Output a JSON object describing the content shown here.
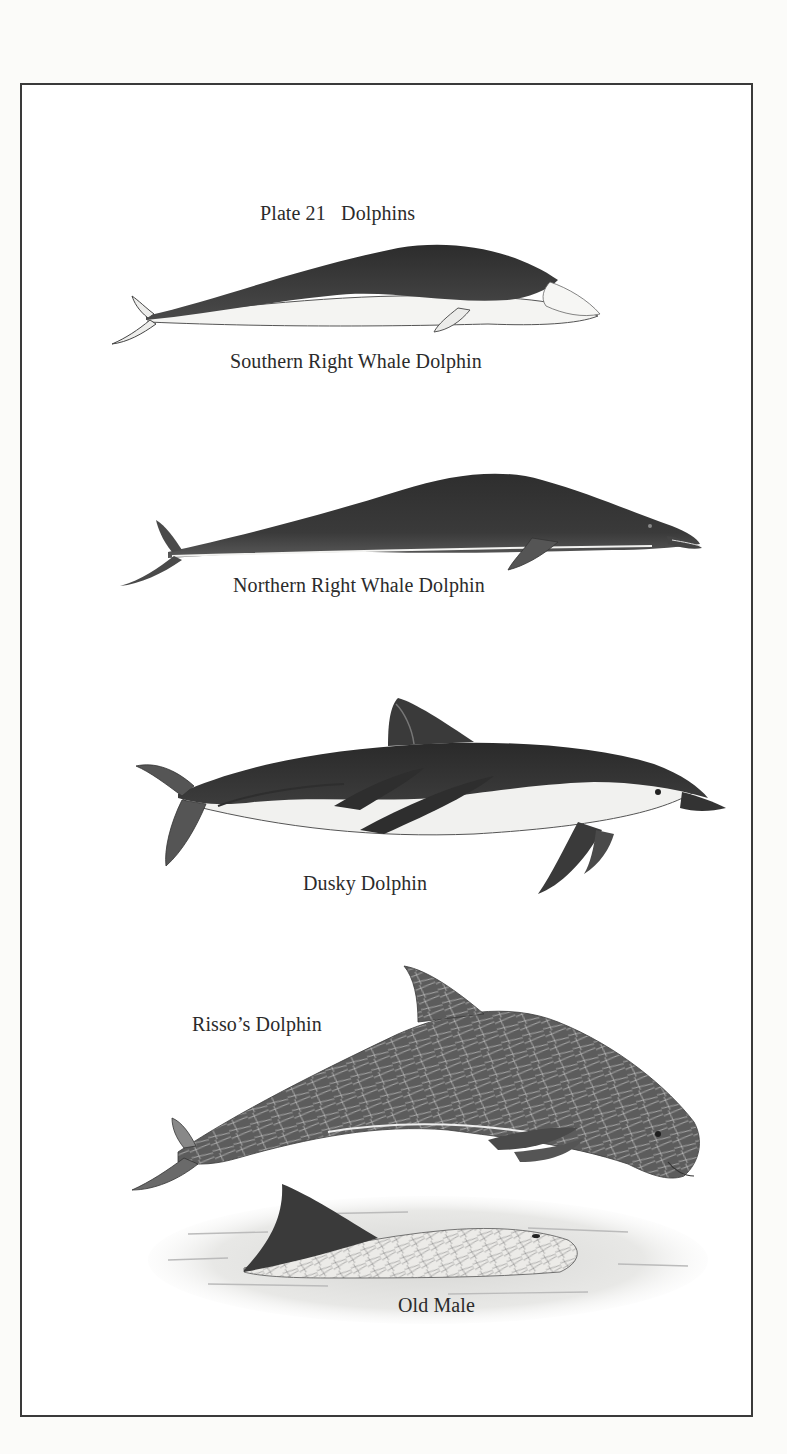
{
  "plate": {
    "title": "Plate 21   Dolphins",
    "frame_color": "#3a3a3a",
    "background": "#ffffff"
  },
  "species": [
    {
      "id": "southern-right-whale-dolphin",
      "label": "Southern Right Whale Dolphin"
    },
    {
      "id": "northern-right-whale-dolphin",
      "label": "Northern Right Whale Dolphin"
    },
    {
      "id": "dusky-dolphin",
      "label": "Dusky Dolphin"
    },
    {
      "id": "rissos-dolphin",
      "label": "Risso’s Dolphin",
      "sub_label": "Old Male"
    }
  ]
}
